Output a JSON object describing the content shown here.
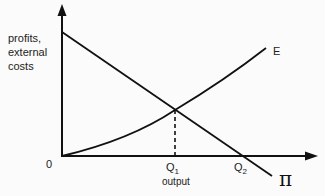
{
  "diagram": {
    "y_axis_label_lines": [
      "profits,",
      "external",
      "costs"
    ],
    "origin_label": "0",
    "curves": {
      "E": {
        "label": "E"
      },
      "pi": {
        "label": "π"
      }
    },
    "x_ticks": {
      "q1": {
        "main": "Q",
        "sub": "1"
      },
      "q2": {
        "main": "Q",
        "sub": "2"
      }
    },
    "x_axis_label": "output"
  },
  "colors": {
    "line": "#111111",
    "text": "#222222",
    "background": "#fbfbfb"
  }
}
